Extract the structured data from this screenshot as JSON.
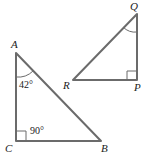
{
  "diagram": {
    "triangle_abc": {
      "vertices": {
        "A": {
          "label": "A"
        },
        "B": {
          "label": "B"
        },
        "C": {
          "label": "C"
        }
      },
      "angle_a": "42°",
      "angle_c": "90°"
    },
    "triangle_pqr": {
      "vertices": {
        "P": {
          "label": "P"
        },
        "Q": {
          "label": "Q"
        },
        "R": {
          "label": "R"
        }
      }
    },
    "colors": {
      "stroke": "#6b6b6b",
      "text": "#222222"
    }
  }
}
